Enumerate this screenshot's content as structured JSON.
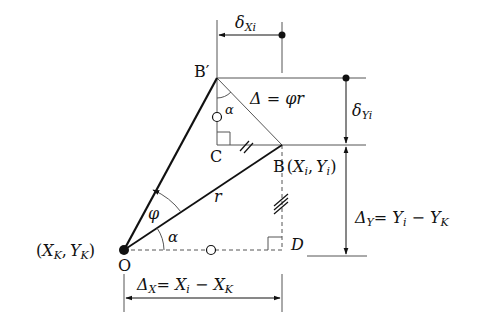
{
  "diagram": {
    "type": "geometry",
    "points": {
      "O": {
        "label": "O",
        "coord_label": "(X_K, Y_K)"
      },
      "B_prime": {
        "label": "B′"
      },
      "B": {
        "label": "B",
        "coord_label": "(X_i, Y_i)"
      },
      "C": {
        "label": "C"
      },
      "D": {
        "label": "D"
      }
    },
    "labels": {
      "O": "O",
      "O_coord_open": "(",
      "O_X": "X",
      "O_Xsub": "K",
      "O_comma": ",",
      "O_Y": "Y",
      "O_Ysub": "K",
      "O_close": ")",
      "B": "B",
      "B_coord_open": "(",
      "B_X": "X",
      "B_Xsub": "i",
      "B_comma": ",",
      "B_Y": "Y",
      "B_Ysub": "i",
      "B_close": ")",
      "B_prime": "B′",
      "C": "C",
      "D": "D",
      "r": "r",
      "phi": "φ",
      "alpha_bottom": "α",
      "alpha_top": "α",
      "delta_eq": "Δ = φr",
      "delta_x_i": "δ",
      "delta_x_i_sub": "Xi",
      "delta_y_i": "δ",
      "delta_y_i_sub": "Yi",
      "dx_delta": "Δ",
      "dx_sub": "X",
      "dx_eq": "= X",
      "dx_sub_i": "i",
      "dx_minus": " − X",
      "dx_sub_k": "K",
      "dy_delta": "Δ",
      "dy_sub": "Y",
      "dy_eq": "= Y",
      "dy_sub_i": "i",
      "dy_minus": " − Y",
      "dy_sub_k": "K"
    },
    "colors": {
      "line": "#111111",
      "guide": "#555555"
    }
  }
}
